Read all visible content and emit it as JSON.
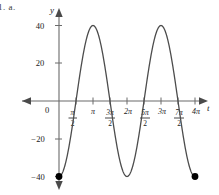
{
  "problem": {
    "label": "1.  a."
  },
  "axes": {
    "y_axis_name": "y",
    "x_axis_name": "t",
    "origin_label": "0",
    "y_ticks": [
      {
        "label": "40",
        "value": 40
      },
      {
        "label": "20",
        "value": 20
      },
      {
        "label": "−20",
        "value": -20
      },
      {
        "label": "−40",
        "value": -40
      }
    ],
    "x_ticks": [
      {
        "label": "π/2",
        "numerator": "π",
        "denominator": "2",
        "is_fraction": true,
        "value": 1.5707963
      },
      {
        "label": "π",
        "numerator": "π",
        "denominator": "",
        "is_fraction": false,
        "value": 3.1415927
      },
      {
        "label": "3π/2",
        "numerator": "3π",
        "denominator": "2",
        "is_fraction": true,
        "value": 4.712389
      },
      {
        "label": "2π",
        "numerator": "2π",
        "denominator": "",
        "is_fraction": false,
        "value": 6.2831853
      },
      {
        "label": "5π/2",
        "numerator": "5π",
        "denominator": "2",
        "is_fraction": true,
        "value": 7.8539816
      },
      {
        "label": "3π",
        "numerator": "3π",
        "denominator": "",
        "is_fraction": false,
        "value": 9.424778
      },
      {
        "label": "7π/2",
        "numerator": "7π",
        "denominator": "2",
        "is_fraction": true,
        "value": 10.9955743
      },
      {
        "label": "4π",
        "numerator": "4π",
        "denominator": "",
        "is_fraction": false,
        "value": 12.5663706
      }
    ]
  },
  "colors": {
    "curve": "#4d4d4d",
    "axis": "#6b6b6b",
    "endpoint": "#000000",
    "text": "#1a1a1a",
    "background": "#ffffff"
  },
  "chart_data": {
    "type": "line",
    "title": "",
    "xlabel": "t",
    "ylabel": "y",
    "function": "y = -40 cos(t)",
    "amplitude": 40,
    "period": 6.2831853,
    "xlim": [
      0,
      12.5663706
    ],
    "ylim": [
      -40,
      40
    ],
    "grid": false,
    "legend": null,
    "series": [
      {
        "name": "y = -40 cos(t)",
        "x": [
          0,
          0.3926991,
          0.7853982,
          1.1780972,
          1.5707963,
          1.9634954,
          2.3561945,
          2.7488936,
          3.1415927,
          3.5342917,
          3.9269908,
          4.3196899,
          4.712389,
          5.1050881,
          5.4977871,
          5.8904862,
          6.2831853,
          6.6758844,
          7.0685835,
          7.4612826,
          7.8539816,
          8.2466807,
          8.6393798,
          9.0320789,
          9.424778,
          9.817477,
          10.2101761,
          10.6028752,
          10.9955743,
          11.3882734,
          11.7809725,
          12.1736715,
          12.5663706
        ],
        "y": [
          -40,
          -36.955,
          -28.284,
          -15.307,
          0,
          15.307,
          28.284,
          36.955,
          40,
          36.955,
          28.284,
          15.307,
          0,
          -15.307,
          -28.284,
          -36.955,
          -40,
          -36.955,
          -28.284,
          -15.307,
          0,
          15.307,
          28.284,
          36.955,
          40,
          36.955,
          28.284,
          15.307,
          0,
          -15.307,
          -28.284,
          -36.955,
          -40
        ]
      }
    ],
    "key_points": [
      {
        "label": "left endpoint",
        "x": 0,
        "y": -40,
        "marker": "filled-circle"
      },
      {
        "label": "first maximum",
        "x": 3.1415927,
        "y": 40,
        "marker": "none"
      },
      {
        "label": "minimum",
        "x": 6.2831853,
        "y": -40,
        "marker": "none"
      },
      {
        "label": "second maximum",
        "x": 9.424778,
        "y": 40,
        "marker": "none"
      },
      {
        "label": "right endpoint",
        "x": 12.5663706,
        "y": -40,
        "marker": "filled-circle"
      }
    ],
    "endpoints": [
      {
        "x": 0,
        "y": -40
      },
      {
        "x": 12.5663706,
        "y": -40
      }
    ]
  }
}
